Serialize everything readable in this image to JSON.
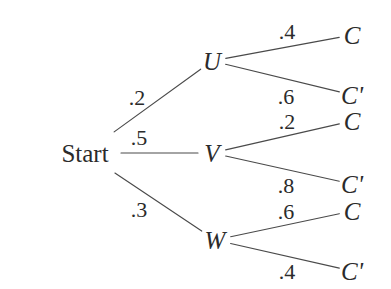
{
  "diagram": {
    "type": "probability-tree",
    "stroke_color": "#4a4a4a",
    "text_color": "#2b2b2b",
    "background_color": "#ffffff",
    "root": {
      "label": "Start",
      "x": 85,
      "y": 153
    },
    "branch_nodes": [
      {
        "id": "U",
        "label": "U",
        "x": 212,
        "y": 61
      },
      {
        "id": "V",
        "label": "V",
        "x": 212,
        "y": 153
      },
      {
        "id": "W",
        "label": "W",
        "x": 215,
        "y": 240
      }
    ],
    "leaf_nodes": [
      {
        "id": "U-C",
        "label": "C",
        "x": 352,
        "y": 35
      },
      {
        "id": "U-Cp",
        "label": "C'",
        "x": 352,
        "y": 95
      },
      {
        "id": "V-C",
        "label": "C",
        "x": 352,
        "y": 121
      },
      {
        "id": "V-Cp",
        "label": "C'",
        "x": 352,
        "y": 184
      },
      {
        "id": "W-C",
        "label": "C",
        "x": 352,
        "y": 211
      },
      {
        "id": "W-Cp",
        "label": "C'",
        "x": 352,
        "y": 271
      }
    ],
    "edges": [
      {
        "id": "start-U",
        "from": "Start",
        "to": "U",
        "probability": ".2",
        "label_x": 137,
        "label_y": 98
      },
      {
        "id": "start-V",
        "from": "Start",
        "to": "V",
        "probability": ".5",
        "label_x": 139,
        "label_y": 138
      },
      {
        "id": "start-W",
        "from": "Start",
        "to": "W",
        "probability": ".3",
        "label_x": 139,
        "label_y": 210
      },
      {
        "id": "U-C",
        "from": "U",
        "to": "C",
        "probability": ".4",
        "label_x": 287,
        "label_y": 32
      },
      {
        "id": "U-Cprime",
        "from": "U",
        "to": "C'",
        "probability": ".6",
        "label_x": 286,
        "label_y": 97
      },
      {
        "id": "V-C",
        "from": "V",
        "to": "C",
        "probability": ".2",
        "label_x": 287,
        "label_y": 122
      },
      {
        "id": "V-Cprime",
        "from": "V",
        "to": "C'",
        "probability": ".8",
        "label_x": 286,
        "label_y": 186
      },
      {
        "id": "W-C",
        "from": "W",
        "to": "C",
        "probability": ".6",
        "label_x": 286,
        "label_y": 212
      },
      {
        "id": "W-Cprime",
        "from": "W",
        "to": "C'",
        "probability": ".4",
        "label_x": 287,
        "label_y": 272
      }
    ]
  },
  "chart_data": {
    "type": "diagram",
    "root": "Start",
    "levels": [
      {
        "name": "first-stage",
        "outcomes": [
          {
            "node": "U",
            "probability": 0.2
          },
          {
            "node": "V",
            "probability": 0.5
          },
          {
            "node": "W",
            "probability": 0.3
          }
        ]
      },
      {
        "name": "second-stage",
        "outcomes": [
          {
            "parent": "U",
            "node": "C",
            "probability": 0.4
          },
          {
            "parent": "U",
            "node": "C'",
            "probability": 0.6
          },
          {
            "parent": "V",
            "node": "C",
            "probability": 0.2
          },
          {
            "parent": "V",
            "node": "C'",
            "probability": 0.8
          },
          {
            "parent": "W",
            "node": "C",
            "probability": 0.6
          },
          {
            "parent": "W",
            "node": "C'",
            "probability": 0.4
          }
        ]
      }
    ]
  }
}
